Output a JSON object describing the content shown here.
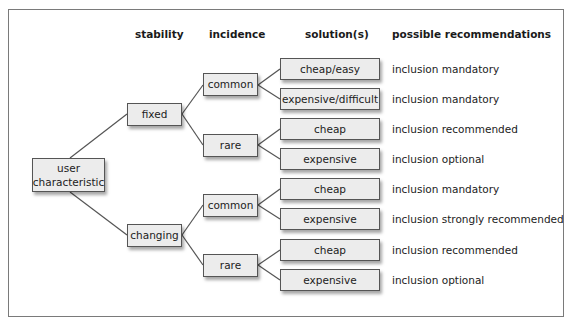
{
  "headers": {
    "stability": "stability",
    "incidence": "incidence",
    "solutions": "solution(s)",
    "recommendations": "possible recommendations"
  },
  "root": {
    "label_line1": "user",
    "label_line2": "characteristic"
  },
  "stability": [
    {
      "label": "fixed"
    },
    {
      "label": "changing"
    }
  ],
  "incidence": [
    {
      "label": "common",
      "parent": "fixed"
    },
    {
      "label": "rare",
      "parent": "fixed"
    },
    {
      "label": "common",
      "parent": "changing"
    },
    {
      "label": "rare",
      "parent": "changing"
    }
  ],
  "solutions": [
    {
      "label": "cheap/easy",
      "recommendation": "inclusion mandatory"
    },
    {
      "label": "expensive/difficult",
      "recommendation": "inclusion mandatory"
    },
    {
      "label": "cheap",
      "recommendation": "inclusion recommended"
    },
    {
      "label": "expensive",
      "recommendation": "inclusion optional"
    },
    {
      "label": "cheap",
      "recommendation": "inclusion mandatory"
    },
    {
      "label": "expensive",
      "recommendation": "inclusion strongly recommended"
    },
    {
      "label": "cheap",
      "recommendation": "inclusion recommended"
    },
    {
      "label": "expensive",
      "recommendation": "inclusion optional"
    }
  ]
}
